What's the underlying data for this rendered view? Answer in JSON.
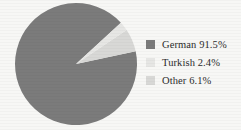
{
  "chart_data": {
    "type": "pie",
    "title": "",
    "categories": [
      "German",
      "Turkish",
      "Other"
    ],
    "values": [
      91.5,
      2.4,
      6.1
    ],
    "value_unit": "%",
    "legend_position": "right",
    "grid": false,
    "slices": [
      {
        "label": "German",
        "value": 91.5,
        "value_text": "91.5%",
        "legend_text": "German 91.5%",
        "color": "#7b7b7b"
      },
      {
        "label": "Turkish",
        "value": 2.4,
        "value_text": "2.4%",
        "legend_text": "Turkish 2.4%",
        "color": "#e6e6e4"
      },
      {
        "label": "Other",
        "value": 6.1,
        "value_text": "6.1%",
        "legend_text": "Other 6.1%",
        "color": "#d8d8d6"
      }
    ],
    "geometry": {
      "center_x": 76,
      "center_y": 64,
      "radius": 61,
      "start_angle_deg": -12
    },
    "colors": {
      "background": "#f7f7f5",
      "text": "#2c2c2c",
      "german": "#7b7b7b",
      "turkish": "#e6e6e4",
      "other": "#d8d8d6"
    }
  }
}
